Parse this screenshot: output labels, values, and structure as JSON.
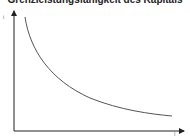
{
  "diagram": {
    "title": "Grenzleistungsfähigkeit des Kapitals",
    "y_axis_label": "i",
    "x_axis_label": "I",
    "curve_description": "downward-sloping convex curve (marginal efficiency of capital)",
    "colors": {
      "axis": "#222222",
      "curve": "#555555",
      "title": "#222222"
    }
  }
}
